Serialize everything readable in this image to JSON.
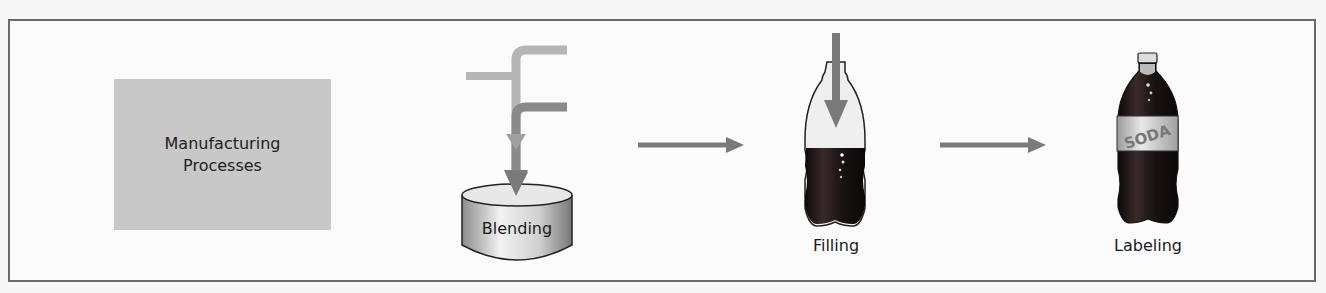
{
  "diagram": {
    "type": "process-flow",
    "source_box": {
      "line1": "Manufacturing",
      "line2": "Processes",
      "fill": "#c8c8c8"
    },
    "steps": [
      {
        "label": "Blending",
        "icon": "mixing-tank-icon"
      },
      {
        "label": "Filling",
        "icon": "bottle-being-filled-icon"
      },
      {
        "label": "Labeling",
        "icon": "labeled-soda-bottle-icon",
        "bottle_label_text": "SODA"
      }
    ],
    "colors": {
      "frame": "#6a6a6a",
      "arrow": "#7a7a7a",
      "pipe_light": "#b5b5b5",
      "pipe_dark": "#8a8a8a",
      "liquid": "#1a1212"
    }
  }
}
